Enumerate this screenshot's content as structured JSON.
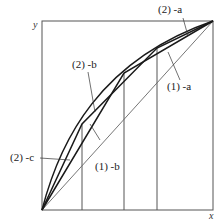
{
  "diagram": {
    "axes": {
      "x_label": "x",
      "y_label": "y"
    },
    "labels": {
      "a2": "(2) -a",
      "b2": "(2) -b",
      "c2": "(2) -c",
      "a1": "(1) -a",
      "b1": "(1) -b"
    },
    "colors": {
      "line": "#1a1a1a",
      "thin": "#555555",
      "background": "#ffffff"
    }
  }
}
